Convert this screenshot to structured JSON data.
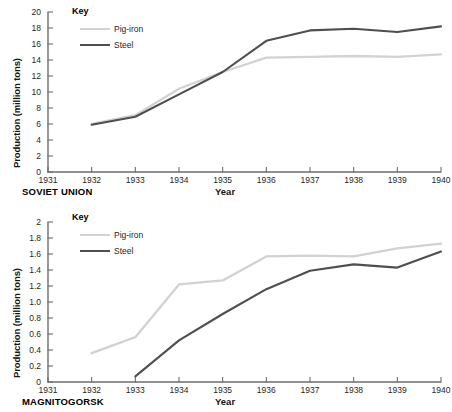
{
  "chart_data": [
    {
      "type": "line",
      "title": "SOVIET UNION",
      "xlabel": "Year",
      "ylabel": "Production (million tons)",
      "legend_title": "Key",
      "legend_position": "top-left-inside",
      "grid": false,
      "x": [
        1931,
        1932,
        1933,
        1934,
        1935,
        1936,
        1937,
        1938,
        1939,
        1940
      ],
      "xlim": [
        1931,
        1940
      ],
      "ylim": [
        0,
        20
      ],
      "xticks": [
        "1931",
        "1932",
        "1933",
        "1934",
        "1935",
        "1936",
        "1937",
        "1938",
        "1939",
        "1940"
      ],
      "yticks": [
        "0",
        "2",
        "4",
        "6",
        "8",
        "10",
        "12",
        "14",
        "16",
        "18",
        "20"
      ],
      "series": [
        {
          "name": "Pig-iron",
          "color": "#d2d2d2",
          "x": [
            1932,
            1933,
            1934,
            1935,
            1936,
            1937,
            1938,
            1939,
            1940
          ],
          "values": [
            6.0,
            7.1,
            10.4,
            12.5,
            14.3,
            14.4,
            14.5,
            14.4,
            14.7
          ]
        },
        {
          "name": "Steel",
          "color": "#4f4f4f",
          "x": [
            1932,
            1933,
            1934,
            1935,
            1936,
            1937,
            1938,
            1939,
            1940
          ],
          "values": [
            5.9,
            6.9,
            9.7,
            12.5,
            16.4,
            17.7,
            17.9,
            17.5,
            18.2
          ]
        }
      ]
    },
    {
      "type": "line",
      "title": "MAGNITOGORSK",
      "xlabel": "Year",
      "ylabel": "Production (million tons)",
      "legend_title": "Key",
      "legend_position": "top-left-inside",
      "grid": false,
      "x": [
        1931,
        1932,
        1933,
        1934,
        1935,
        1936,
        1937,
        1938,
        1939,
        1940
      ],
      "xlim": [
        1931,
        1940
      ],
      "ylim": [
        0,
        2
      ],
      "xticks": [
        "1931",
        "1932",
        "1933",
        "1934",
        "1935",
        "1936",
        "1937",
        "1938",
        "1939",
        "1940"
      ],
      "yticks": [
        "0",
        "0.2",
        "0.4",
        "0.6",
        "0.8",
        "1.0",
        "1.2",
        "1.4",
        "1.6",
        "1.8",
        "2"
      ],
      "series": [
        {
          "name": "Pig-iron",
          "color": "#d2d2d2",
          "x": [
            1932,
            1933,
            1934,
            1935,
            1936,
            1937,
            1938,
            1939,
            1940
          ],
          "values": [
            0.36,
            0.56,
            1.22,
            1.27,
            1.57,
            1.58,
            1.57,
            1.67,
            1.73
          ]
        },
        {
          "name": "Steel",
          "color": "#4f4f4f",
          "x": [
            1933,
            1934,
            1935,
            1936,
            1937,
            1938,
            1939,
            1940
          ],
          "values": [
            0.07,
            0.52,
            0.85,
            1.16,
            1.39,
            1.47,
            1.43,
            1.63
          ]
        }
      ]
    }
  ]
}
